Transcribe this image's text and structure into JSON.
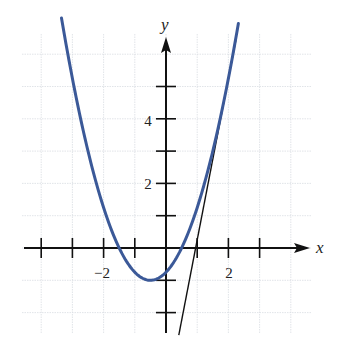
{
  "chart_data": {
    "type": "line",
    "title": "",
    "xlabel": "x",
    "ylabel": "y",
    "xlim": [
      -4,
      4
    ],
    "ylim": [
      -3,
      7
    ],
    "grid": true,
    "legend": null,
    "x_ticks": [
      -4,
      -3,
      -2,
      -1,
      1,
      2,
      3
    ],
    "x_tick_labels": [
      {
        "value": -2,
        "label": "−2"
      },
      {
        "value": 2,
        "label": "2"
      }
    ],
    "y_ticks": [
      -2,
      -1,
      1,
      2,
      3,
      4,
      5
    ],
    "y_tick_labels": [
      {
        "value": 2,
        "label": "2"
      },
      {
        "value": 4,
        "label": "4"
      }
    ],
    "series": [
      {
        "name": "parabola",
        "kind": "curve",
        "equation": "y = x^2 + x - 0.75",
        "color": "#3b5998",
        "x_range": [
          -3.35,
          2.32
        ],
        "x": [
          -3.35,
          -3,
          -2.5,
          -2,
          -1.5,
          -1,
          -0.5,
          0,
          0.5,
          1,
          1.5,
          2,
          2.32
        ],
        "values": [
          7.12,
          5.25,
          3.0,
          1.25,
          0.0,
          -0.75,
          -1.0,
          -0.75,
          0.0,
          1.25,
          3.0,
          5.25,
          6.95
        ]
      },
      {
        "name": "tangent line at x = 2",
        "kind": "line",
        "equation": "y = 5x - 4.75",
        "color": "#111111",
        "x": [
          0.41,
          2.25
        ],
        "values": [
          -2.7,
          6.5
        ]
      }
    ],
    "annotations": [
      {
        "text": "x",
        "role": "x-axis label"
      },
      {
        "text": "y",
        "role": "y-axis label"
      }
    ]
  },
  "labels": {
    "x_axis": "x",
    "y_axis": "y",
    "x_tick_neg2": "−2",
    "x_tick_2": "2",
    "y_tick_2": "2",
    "y_tick_4": "4"
  },
  "colors": {
    "curve": "#3b5998",
    "tangent": "#111111",
    "axis": "#111111",
    "grid": "#d9dde2"
  }
}
